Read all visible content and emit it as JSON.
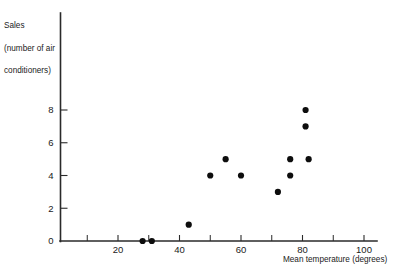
{
  "chart_data": {
    "type": "scatter",
    "title": "",
    "xlabel": "Mean temperature (degrees)",
    "ylabel_lines": [
      "Sales",
      "(number of air",
      "conditioners)"
    ],
    "ylabel": "Sales (number of air conditioners)",
    "xlim": [
      0,
      103
    ],
    "ylim": [
      0,
      10
    ],
    "grid": false,
    "legend": null,
    "x_ticks_major": [
      20,
      40,
      60,
      80,
      100
    ],
    "x_tick_labels": [
      "20",
      "40",
      "60",
      "80",
      "100"
    ],
    "x_ticks_minor": [
      10,
      30,
      50,
      70,
      90
    ],
    "y_ticks_major": [
      0,
      2,
      4,
      6,
      8
    ],
    "y_tick_labels": [
      "0",
      "2",
      "4",
      "6",
      "8"
    ],
    "marker": "filled-circle",
    "marker_color": "#0d0d0d",
    "points": [
      {
        "x": 28,
        "y": 0
      },
      {
        "x": 31,
        "y": 0
      },
      {
        "x": 43,
        "y": 1
      },
      {
        "x": 50,
        "y": 4
      },
      {
        "x": 55,
        "y": 5
      },
      {
        "x": 60,
        "y": 4
      },
      {
        "x": 72,
        "y": 3
      },
      {
        "x": 76,
        "y": 4
      },
      {
        "x": 76,
        "y": 5
      },
      {
        "x": 81,
        "y": 7
      },
      {
        "x": 81,
        "y": 8
      },
      {
        "x": 82,
        "y": 5
      }
    ]
  },
  "colors": {
    "axis": "#2a2a2a",
    "marker": "#0d0d0d",
    "text": "#1a1a1a",
    "background": "#ffffff"
  }
}
